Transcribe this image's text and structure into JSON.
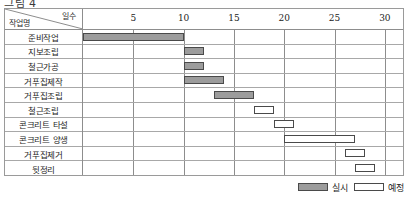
{
  "figure_caption": "그림 4",
  "header": {
    "task_column_label": "작업명",
    "days_column_label": "일수"
  },
  "legend": {
    "actual_label": "실시",
    "planned_label": "예정"
  },
  "colors": {
    "actual_fill": "#9c9c9c",
    "planned_fill": "#ffffff",
    "bar_border": "#4a4a4a",
    "grid_line": "#a8a8a8",
    "frame": "#8d8d8d"
  },
  "chart_data": {
    "type": "bar",
    "title": "",
    "xlabel": "일수",
    "ylabel": "작업명",
    "xlim": [
      0,
      32
    ],
    "xticks": [
      5,
      10,
      15,
      20,
      25,
      30
    ],
    "xtick_labels": [
      "5",
      "10",
      "15",
      "20",
      "25",
      "30"
    ],
    "grid": true,
    "legend_position": "bottom-right",
    "orientation": "horizontal",
    "categories": [
      "준비작업",
      "지보조립",
      "철근가공",
      "거푸집제작",
      "거푸집조립",
      "철근조립",
      "콘크리트 타설",
      "콘크리트 양생",
      "거푸집제거",
      "뒷정리"
    ],
    "series": [
      {
        "name": "실시",
        "type": "actual",
        "bars": [
          {
            "category": "준비작업",
            "start": 0,
            "end": 10,
            "duration": 10
          },
          {
            "category": "지보조립",
            "start": 10,
            "end": 12,
            "duration": 2
          },
          {
            "category": "철근가공",
            "start": 10,
            "end": 12,
            "duration": 2
          },
          {
            "category": "거푸집제작",
            "start": 10,
            "end": 14,
            "duration": 4
          },
          {
            "category": "거푸집조립",
            "start": 13,
            "end": 17,
            "duration": 4
          }
        ]
      },
      {
        "name": "예정",
        "type": "planned",
        "bars": [
          {
            "category": "철근조립",
            "start": 17,
            "end": 19,
            "duration": 2
          },
          {
            "category": "콘크리트 타설",
            "start": 19,
            "end": 21,
            "duration": 2
          },
          {
            "category": "콘크리트 양생",
            "start": 20,
            "end": 27,
            "duration": 7
          },
          {
            "category": "거푸집제거",
            "start": 26,
            "end": 28,
            "duration": 2
          },
          {
            "category": "뒷정리",
            "start": 27,
            "end": 29,
            "duration": 2
          }
        ]
      }
    ],
    "rows": [
      {
        "label": "준비작업",
        "type": "actual",
        "start": 0,
        "end": 10
      },
      {
        "label": "지보조립",
        "type": "actual",
        "start": 10,
        "end": 12
      },
      {
        "label": "철근가공",
        "type": "actual",
        "start": 10,
        "end": 12
      },
      {
        "label": "거푸집제작",
        "type": "actual",
        "start": 10,
        "end": 14
      },
      {
        "label": "거푸집조립",
        "type": "actual",
        "start": 13,
        "end": 17
      },
      {
        "label": "철근조립",
        "type": "planned",
        "start": 17,
        "end": 19
      },
      {
        "label": "콘크리트 타설",
        "type": "planned",
        "start": 19,
        "end": 21
      },
      {
        "label": "콘크리트 양생",
        "type": "planned",
        "start": 20,
        "end": 27
      },
      {
        "label": "거푸집제거",
        "type": "planned",
        "start": 26,
        "end": 28
      },
      {
        "label": "뒷정리",
        "type": "planned",
        "start": 27,
        "end": 29
      }
    ]
  }
}
